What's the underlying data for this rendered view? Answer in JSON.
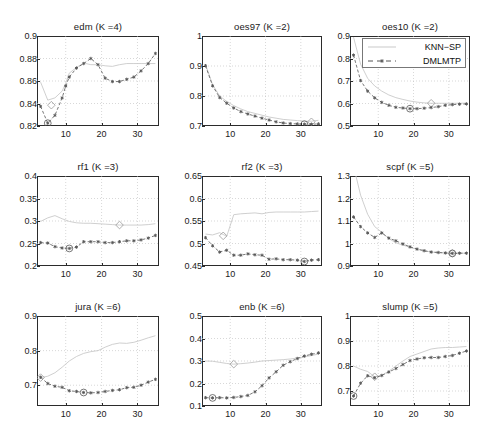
{
  "figure": {
    "type": "multi-panel-line-chart",
    "rows": 3,
    "cols": 3,
    "background": "#ffffff",
    "series_colors": {
      "knn_sp": "#c9c9c9",
      "dmlmtp": "#555555"
    },
    "legend": {
      "position": "top-right of panel oes10",
      "entries": [
        {
          "name": "KNN-SP",
          "label": "KNN−SP",
          "style": "solid",
          "marker": "none",
          "color": "#c9c9c9"
        },
        {
          "name": "DMLMTP",
          "label": "DMLMTP",
          "style": "dashed",
          "marker": "star",
          "color": "#555555"
        }
      ]
    },
    "annotations": {
      "knn_sp_optimum_marker": "diamond",
      "dmlmtp_optimum_marker": "circle"
    }
  },
  "chart_data": [
    {
      "type": "line",
      "title": "edm (K =4)",
      "dataset": "edm",
      "K": 4,
      "xlabel": "",
      "ylabel": "",
      "xlim": [
        2,
        36
      ],
      "ylim": [
        0.82,
        0.9
      ],
      "xticks": [
        10,
        20,
        30
      ],
      "yticks": [
        "0.82",
        "0.84",
        "0.86",
        "0.88",
        "0.9"
      ],
      "grid": true,
      "x": [
        3,
        5,
        7,
        9,
        10,
        11,
        13,
        15,
        17,
        19,
        21,
        23,
        25,
        27,
        29,
        31,
        33,
        35
      ],
      "series": [
        {
          "name": "KNN-SP",
          "values": [
            0.859,
            0.843,
            0.845,
            0.851,
            0.858,
            0.867,
            0.872,
            0.876,
            0.8745,
            0.8745,
            0.8735,
            0.873,
            0.8745,
            0.8755,
            0.8755,
            0.8755,
            0.8755,
            0.8755
          ],
          "optimum": {
            "x": 6,
            "y": 0.8385,
            "marker": "diamond"
          }
        },
        {
          "name": "DMLMTP",
          "values": [
            0.8375,
            0.8225,
            0.8295,
            0.845,
            0.8555,
            0.8635,
            0.8715,
            0.8755,
            0.88,
            0.8745,
            0.8625,
            0.8595,
            0.8595,
            0.8615,
            0.8635,
            0.869,
            0.8755,
            0.8845
          ],
          "optimum": {
            "x": 5,
            "y": 0.8225,
            "marker": "circle"
          }
        }
      ]
    },
    {
      "type": "line",
      "title": "oes97 (K =2)",
      "dataset": "oes97",
      "K": 2,
      "xlabel": "",
      "ylabel": "",
      "xlim": [
        2,
        36
      ],
      "ylim": [
        0.7,
        1.0
      ],
      "xticks": [
        10,
        20,
        30
      ],
      "yticks": [
        "0.7",
        "0.8",
        "0.9",
        "1"
      ],
      "grid": true,
      "x": [
        3,
        5,
        7,
        9,
        11,
        13,
        15,
        17,
        19,
        21,
        23,
        25,
        27,
        29,
        31,
        33,
        35
      ],
      "series": [
        {
          "name": "KNN-SP",
          "values": [
            0.905,
            0.838,
            0.8,
            0.782,
            0.768,
            0.757,
            0.748,
            0.742,
            0.736,
            0.73,
            0.726,
            0.722,
            0.72,
            0.718,
            0.716,
            0.716,
            0.719
          ],
          "optimum": {
            "x": 33,
            "y": 0.714,
            "marker": "diamond"
          }
        },
        {
          "name": "DMLMTP",
          "values": [
            0.901,
            0.834,
            0.795,
            0.776,
            0.76,
            0.748,
            0.74,
            0.733,
            0.726,
            0.72,
            0.714,
            0.71,
            0.708,
            0.707,
            0.706,
            0.706,
            0.707
          ],
          "optimum": {
            "x": 31,
            "y": 0.706,
            "marker": "circle"
          }
        }
      ]
    },
    {
      "type": "line",
      "title": "oes10 (K =2)",
      "dataset": "oes10",
      "K": 2,
      "xlabel": "",
      "ylabel": "",
      "xlim": [
        2,
        36
      ],
      "ylim": [
        0.5,
        0.9
      ],
      "xticks": [
        10,
        20,
        30
      ],
      "yticks": [
        "0.5",
        "0.6",
        "0.7",
        "0.8",
        "0.9"
      ],
      "grid": true,
      "x": [
        3,
        5,
        7,
        9,
        11,
        13,
        15,
        17,
        19,
        21,
        23,
        25,
        27,
        29,
        31,
        33,
        35
      ],
      "series": [
        {
          "name": "KNN-SP",
          "values": [
            0.895,
            0.775,
            0.712,
            0.678,
            0.655,
            0.638,
            0.626,
            0.618,
            0.611,
            0.606,
            0.603,
            0.601,
            0.601,
            0.601,
            0.601,
            0.601,
            0.602
          ],
          "optimum": {
            "x": 25,
            "y": 0.601,
            "marker": "diamond"
          }
        },
        {
          "name": "DMLMTP",
          "values": [
            0.815,
            0.702,
            0.655,
            0.625,
            0.605,
            0.592,
            0.583,
            0.58,
            0.577,
            0.577,
            0.579,
            0.582,
            0.586,
            0.592,
            0.595,
            0.597,
            0.598
          ],
          "optimum": {
            "x": 19,
            "y": 0.577,
            "marker": "circle"
          }
        }
      ]
    },
    {
      "type": "line",
      "title": "rf1 (K =3)",
      "dataset": "rf1",
      "K": 3,
      "xlabel": "",
      "ylabel": "",
      "xlim": [
        2,
        36
      ],
      "ylim": [
        0.2,
        0.4
      ],
      "xticks": [
        10,
        20,
        30
      ],
      "yticks": [
        "0.2",
        "0.25",
        "0.3",
        "0.35",
        "0.4"
      ],
      "grid": true,
      "x": [
        3,
        5,
        7,
        9,
        11,
        13,
        15,
        17,
        19,
        21,
        23,
        25,
        27,
        29,
        31,
        33,
        35
      ],
      "series": [
        {
          "name": "KNN-SP",
          "values": [
            0.299,
            0.307,
            0.312,
            0.305,
            0.299,
            0.296,
            0.295,
            0.295,
            0.294,
            0.293,
            0.292,
            0.291,
            0.291,
            0.291,
            0.291,
            0.292,
            0.294
          ],
          "optimum": {
            "x": 25,
            "y": 0.291,
            "marker": "diamond"
          }
        },
        {
          "name": "DMLMTP",
          "values": [
            0.252,
            0.251,
            0.243,
            0.24,
            0.239,
            0.242,
            0.254,
            0.254,
            0.254,
            0.252,
            0.252,
            0.254,
            0.256,
            0.256,
            0.258,
            0.262,
            0.268
          ],
          "optimum": {
            "x": 11,
            "y": 0.239,
            "marker": "circle"
          }
        }
      ]
    },
    {
      "type": "line",
      "title": "rf2 (K =3)",
      "dataset": "rf2",
      "K": 3,
      "xlabel": "",
      "ylabel": "",
      "xlim": [
        2,
        36
      ],
      "ylim": [
        0.45,
        0.65
      ],
      "xticks": [
        10,
        20,
        30
      ],
      "yticks": [
        "0.45",
        "0.5",
        "0.55",
        "0.6",
        "0.65"
      ],
      "grid": true,
      "x": [
        3,
        5,
        7,
        9,
        11,
        13,
        15,
        17,
        19,
        21,
        23,
        25,
        27,
        29,
        31,
        33,
        35
      ],
      "series": [
        {
          "name": "KNN-SP",
          "values": [
            0.521,
            0.519,
            0.524,
            0.516,
            0.564,
            0.566,
            0.567,
            0.568,
            0.566,
            0.569,
            0.57,
            0.57,
            0.57,
            0.57,
            0.57,
            0.571,
            0.572
          ],
          "optimum": {
            "x": 8,
            "y": 0.517,
            "marker": "diamond"
          }
        },
        {
          "name": "DMLMTP",
          "values": [
            0.513,
            0.495,
            0.481,
            0.485,
            0.474,
            0.474,
            0.477,
            0.475,
            0.474,
            0.465,
            0.466,
            0.464,
            0.464,
            0.463,
            0.46,
            0.463,
            0.464
          ],
          "optimum": {
            "x": 31,
            "y": 0.46,
            "marker": "circle"
          }
        }
      ]
    },
    {
      "type": "line",
      "title": "scpf (K =5)",
      "dataset": "scpf",
      "K": 5,
      "xlabel": "",
      "ylabel": "",
      "xlim": [
        2,
        36
      ],
      "ylim": [
        0.9,
        1.3
      ],
      "xticks": [
        10,
        20,
        30
      ],
      "yticks": [
        "0.9",
        "1",
        "1.1",
        "1.2",
        "1.3"
      ],
      "grid": true,
      "x": [
        3,
        5,
        7,
        9,
        11,
        13,
        15,
        17,
        19,
        21,
        23,
        25,
        27,
        29,
        31,
        33,
        35
      ],
      "series": [
        {
          "name": "KNN-SP",
          "values": [
            1.345,
            1.215,
            1.13,
            1.075,
            1.05,
            1.022,
            1.003,
            0.993,
            0.983,
            0.975,
            0.968,
            0.962,
            0.96,
            0.958,
            0.957,
            0.957,
            0.957
          ],
          "optimum": {
            "x": 31,
            "y": 0.956,
            "marker": "diamond"
          }
        },
        {
          "name": "DMLMTP",
          "values": [
            1.118,
            1.075,
            1.047,
            1.027,
            1.047,
            1.024,
            1.012,
            0.998,
            0.985,
            0.975,
            0.968,
            0.962,
            0.96,
            0.958,
            0.956,
            0.957,
            0.957
          ],
          "optimum": {
            "x": 31,
            "y": 0.956,
            "marker": "circle"
          }
        }
      ]
    },
    {
      "type": "line",
      "title": "jura (K =6)",
      "dataset": "jura",
      "K": 6,
      "xlabel": "",
      "ylabel": "",
      "xlim": [
        2,
        36
      ],
      "ylim": [
        0.64,
        0.9
      ],
      "xticks": [
        10,
        20,
        30
      ],
      "yticks": [
        "0.7",
        "0.8",
        "0.9"
      ],
      "grid": true,
      "x": [
        3,
        5,
        7,
        9,
        11,
        13,
        15,
        17,
        19,
        21,
        23,
        25,
        27,
        29,
        31,
        33,
        35
      ],
      "series": [
        {
          "name": "KNN-SP",
          "values": [
            0.722,
            0.726,
            0.736,
            0.752,
            0.77,
            0.783,
            0.792,
            0.797,
            0.8,
            0.81,
            0.818,
            0.822,
            0.821,
            0.824,
            0.83,
            0.837,
            0.843
          ],
          "optimum": {
            "x": 3,
            "y": 0.722,
            "marker": "diamond"
          }
        },
        {
          "name": "DMLMTP",
          "values": [
            0.723,
            0.705,
            0.697,
            0.694,
            0.684,
            0.682,
            0.679,
            0.678,
            0.679,
            0.682,
            0.685,
            0.687,
            0.693,
            0.694,
            0.7,
            0.709,
            0.717
          ],
          "optimum": {
            "x": 15,
            "y": 0.679,
            "marker": "circle"
          }
        }
      ]
    },
    {
      "type": "line",
      "title": "enb (K =6)",
      "dataset": "enb",
      "K": 6,
      "xlabel": "",
      "ylabel": "",
      "xlim": [
        2,
        36
      ],
      "ylim": [
        0.1,
        0.5
      ],
      "xticks": [
        10,
        20,
        30
      ],
      "yticks": [
        "0.1",
        "0.2",
        "0.3",
        "0.4",
        "0.5"
      ],
      "grid": true,
      "x": [
        3,
        5,
        7,
        9,
        11,
        13,
        15,
        17,
        19,
        21,
        23,
        25,
        27,
        29,
        31,
        33,
        35
      ],
      "series": [
        {
          "name": "KNN-SP",
          "values": [
            0.3,
            0.299,
            0.294,
            0.289,
            0.286,
            0.288,
            0.291,
            0.295,
            0.3,
            0.302,
            0.304,
            0.306,
            0.309,
            0.313,
            0.318,
            0.324,
            0.331
          ],
          "optimum": {
            "x": 11,
            "y": 0.286,
            "marker": "diamond"
          }
        },
        {
          "name": "DMLMTP",
          "values": [
            0.137,
            0.136,
            0.137,
            0.136,
            0.138,
            0.142,
            0.147,
            0.163,
            0.19,
            0.225,
            0.252,
            0.281,
            0.297,
            0.311,
            0.322,
            0.33,
            0.336
          ],
          "optimum": {
            "x": 5,
            "y": 0.136,
            "marker": "circle"
          }
        }
      ]
    },
    {
      "type": "line",
      "title": "slump (K =5)",
      "dataset": "slump",
      "K": 5,
      "xlabel": "",
      "ylabel": "",
      "xlim": [
        2,
        36
      ],
      "ylim": [
        0.64,
        1.0
      ],
      "xticks": [
        10,
        20,
        30
      ],
      "yticks": [
        "0.7",
        "0.8",
        "0.9",
        "1"
      ],
      "grid": true,
      "x": [
        3,
        5,
        7,
        9,
        11,
        13,
        15,
        17,
        19,
        21,
        23,
        25,
        27,
        29,
        31,
        33,
        35
      ],
      "series": [
        {
          "name": "KNN-SP",
          "values": [
            0.8,
            0.787,
            0.778,
            0.757,
            0.763,
            0.779,
            0.8,
            0.82,
            0.838,
            0.848,
            0.858,
            0.868,
            0.872,
            0.874,
            0.874,
            0.876,
            0.878
          ],
          "optimum": {
            "x": 9,
            "y": 0.757,
            "marker": "diamond"
          }
        },
        {
          "name": "DMLMTP",
          "values": [
            0.68,
            0.731,
            0.761,
            0.753,
            0.762,
            0.776,
            0.79,
            0.806,
            0.822,
            0.828,
            0.833,
            0.834,
            0.834,
            0.838,
            0.842,
            0.851,
            0.86
          ],
          "optimum": {
            "x": 3,
            "y": 0.68,
            "marker": "circle"
          }
        }
      ]
    }
  ]
}
